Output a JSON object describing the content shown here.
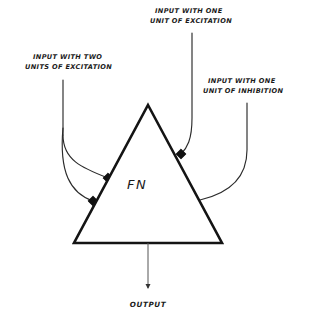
{
  "figure": {
    "background_color": "#ffffff",
    "ink_color": "#141414"
  },
  "neuron": {
    "body_label": "FN",
    "shape": "triangle",
    "apex": {
      "x": 148,
      "y": 105
    },
    "bottom_left": {
      "x": 74,
      "y": 243
    },
    "bottom_right": {
      "x": 222,
      "y": 243
    }
  },
  "inputs": [
    {
      "id": "input-two-excitation",
      "label_line1": "INPUT WITH TWO",
      "label_line2": "UNITS OF EXCITATION",
      "label_x": 33,
      "label_y": 59,
      "type": "excitatory",
      "units": 2,
      "marker_style": "filled-square",
      "marker_color": "#111111",
      "stem_x": 63,
      "stem_top_y": 80,
      "synapses": [
        {
          "x": 108,
          "y": 178
        },
        {
          "x": 93,
          "y": 201
        }
      ]
    },
    {
      "id": "input-one-excitation",
      "label_line1": "INPUT WITH ONE",
      "label_line2": "UNIT OF EXCITATION",
      "label_x": 155,
      "label_y": 13,
      "type": "excitatory",
      "units": 1,
      "marker_style": "filled-square",
      "marker_color": "#111111",
      "stem_x": 192,
      "stem_top_y": 33,
      "synapses": [
        {
          "x": 181,
          "y": 154
        }
      ]
    },
    {
      "id": "input-one-inhibition",
      "label_line1": "INPUT WITH ONE",
      "label_line2": "UNIT OF INHIBITION",
      "label_x": 208,
      "label_y": 83,
      "type": "inhibitory",
      "units": 1,
      "marker_style": "hollow-circle",
      "marker_color": "#ffffff",
      "stem_x": 247,
      "stem_top_y": 103,
      "synapses": [
        {
          "x": 196,
          "y": 201
        }
      ]
    }
  ],
  "output": {
    "label": "OUTPUT",
    "label_x": 148,
    "label_y": 307,
    "arrow_from": {
      "x": 148,
      "y": 243
    },
    "arrow_to": {
      "x": 148,
      "y": 290
    },
    "arrow_color": "#555555"
  }
}
